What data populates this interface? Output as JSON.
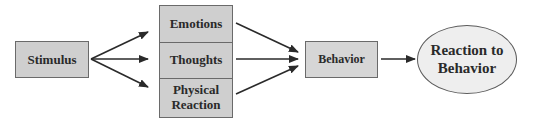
{
  "diagram": {
    "type": "flowchart",
    "nodes": {
      "stimulus": {
        "label": "Stimulus",
        "shape": "rectangle"
      },
      "responses": [
        {
          "label": "Emotions",
          "shape": "rectangle"
        },
        {
          "label": "Thoughts",
          "shape": "rectangle"
        },
        {
          "label": "Physical Reaction",
          "shape": "rectangle"
        }
      ],
      "behavior": {
        "label": "Behavior",
        "shape": "rectangle"
      },
      "reaction": {
        "label": "Reaction to Behavior",
        "shape": "ellipse"
      }
    },
    "edges": [
      {
        "from": "Stimulus",
        "to": "Emotions"
      },
      {
        "from": "Stimulus",
        "to": "Thoughts"
      },
      {
        "from": "Stimulus",
        "to": "Physical Reaction"
      },
      {
        "from": "Emotions",
        "to": "Behavior"
      },
      {
        "from": "Thoughts",
        "to": "Behavior"
      },
      {
        "from": "Physical Reaction",
        "to": "Behavior"
      },
      {
        "from": "Behavior",
        "to": "Reaction to Behavior"
      }
    ],
    "colors": {
      "box_fill": "#cfcfcf",
      "ellipse_fill": "#eeeeee",
      "border": "#6a6a6a",
      "arrow": "#2a2a2a",
      "text": "#2a2a2a"
    }
  }
}
